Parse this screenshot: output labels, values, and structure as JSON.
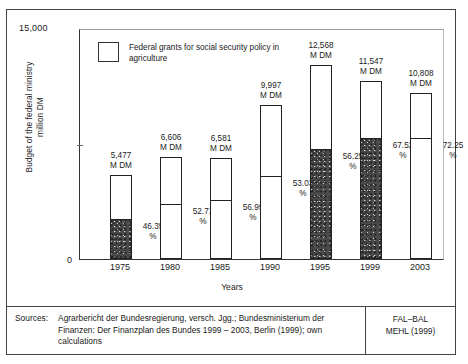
{
  "chart_data": {
    "type": "bar",
    "title": "",
    "xlabel": "Years",
    "ylabel": "Budget of the federal ministry\nmillion DM",
    "ylabel_line1": "Budget of the federal ministry",
    "ylabel_line2": "million DM",
    "ylim": [
      0,
      15000
    ],
    "ytick_labels": [
      "15,000",
      "0"
    ],
    "ytick_top": "15,000",
    "ytick_zero": "0",
    "grid": false,
    "legend": {
      "position": "inside-top-left",
      "entries": [
        {
          "label": "Federal grants for social security policy in agriculture",
          "fill": "white-box"
        }
      ]
    },
    "unit_suffix": "M DM",
    "categories": [
      "1975",
      "1980",
      "1985",
      "1990",
      "1995",
      "1999",
      "2003"
    ],
    "values": [
      5477,
      6606,
      6581,
      9997,
      12568,
      11547,
      10808
    ],
    "value_labels": [
      "5,477\nM DM",
      "6,606\nM DM",
      "6,581\nM DM",
      "9,997\nM DM",
      "12,568\nM DM",
      "11,547\nM DM",
      "10,808\nM DM"
    ],
    "share_percent": [
      46.35,
      52.71,
      56.99,
      53.03,
      56.25,
      67.52,
      72.25
    ],
    "share_labels": [
      "46.35\n%",
      "52.71\n%",
      "56.99\n%",
      "53.03\n%",
      "56.25\n%",
      "67.52\n%",
      "72.25\n%"
    ],
    "segment_fill": [
      "stipple",
      "plain",
      "plain",
      "plain",
      "stipple",
      "stipple",
      "plain"
    ],
    "series": [
      {
        "name": "Federal grants for social security policy in agriculture",
        "values": [
          2539,
          3482,
          3751,
          5302,
          7070,
          7796,
          7809
        ]
      },
      {
        "name": "Remaining budget of the federal ministry",
        "values": [
          2938,
          3124,
          2830,
          4695,
          5498,
          3751,
          2999
        ]
      }
    ]
  },
  "sources": {
    "label": "Sources:",
    "text": "Agrarbericht der Bundesregierung, versch. Jgg.; Bundesministerium der Finanzen: Der Finanzplan des Bundes 1999 – 2003, Berlin (1999); own calculations",
    "credit_line1": "FAL–BAL",
    "credit_line2": "MEHL (1999)"
  }
}
